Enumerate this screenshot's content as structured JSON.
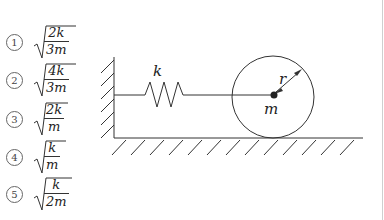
{
  "choices": [
    {
      "number": "1",
      "numerator": "2k",
      "denominator": "3m"
    },
    {
      "number": "2",
      "numerator": "4k",
      "denominator": "3m"
    },
    {
      "number": "3",
      "numerator": "2k",
      "denominator": "m"
    },
    {
      "number": "4",
      "numerator": "k",
      "denominator": "m"
    },
    {
      "number": "5",
      "numerator": "k",
      "denominator": "2m"
    }
  ],
  "figure": {
    "spring_label": "k",
    "radius_label": "r",
    "mass_label": "m"
  }
}
